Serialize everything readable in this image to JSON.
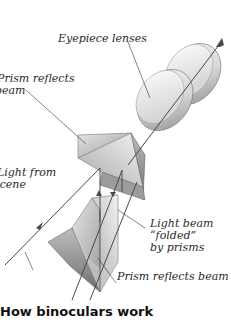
{
  "diagram": {
    "title": "How binoculars work",
    "labels": {
      "eyepiece": "Eyepiece lenses",
      "prism_top_1": "Prism reflects",
      "prism_top_2": "beam",
      "light_1": "Light from",
      "light_2": "scene",
      "folded_1": "Light beam",
      "folded_2": "“folded”",
      "folded_3": "by prisms",
      "prism_bottom": "Prism reflects beam"
    },
    "components": [
      "eyepiece-lenses",
      "upper-prism",
      "lower-prism",
      "light-beam"
    ]
  }
}
